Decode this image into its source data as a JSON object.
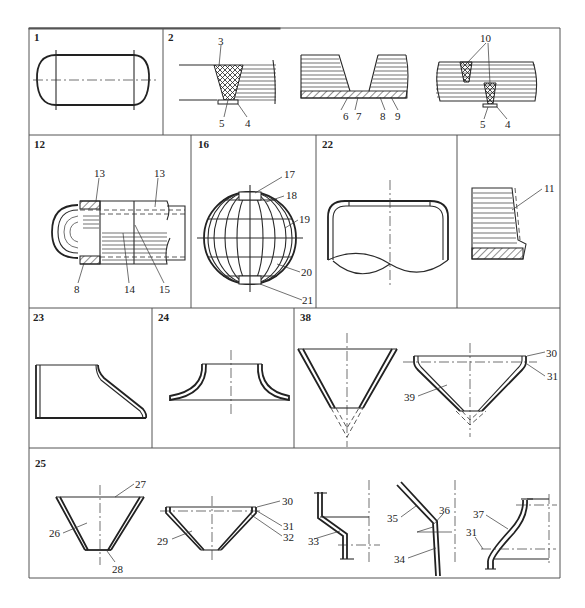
{
  "figure": {
    "panels": [
      {
        "id": "1",
        "label": "1",
        "subject": "cylindrical vessel with hemispherical heads",
        "callouts": []
      },
      {
        "id": "2",
        "label": "2",
        "subject": "weld joint cross-sections",
        "callouts": [
          "3",
          "4",
          "5",
          "6",
          "7",
          "8",
          "9",
          "10",
          "5",
          "4"
        ]
      },
      {
        "id": "12",
        "label": "12",
        "subject": "cutaway vessel with cladding",
        "callouts": [
          "13",
          "13",
          "8",
          "14",
          "15"
        ]
      },
      {
        "id": "16",
        "label": "16",
        "subject": "spherical vessel segmented construction",
        "callouts": [
          "17",
          "18",
          "19",
          "20",
          "21"
        ]
      },
      {
        "id": "22",
        "label": "22",
        "subject": "dished end",
        "callouts": []
      },
      {
        "id": "11",
        "label": "",
        "subject": "lined plate section",
        "callouts": [
          "11"
        ]
      },
      {
        "id": "23",
        "label": "23",
        "subject": "offset conical shell",
        "callouts": []
      },
      {
        "id": "24",
        "label": "24",
        "subject": "flared (toroidal) head",
        "callouts": []
      },
      {
        "id": "38",
        "label": "38",
        "subject": "conical heads",
        "callouts": [
          "30",
          "31",
          "39"
        ]
      },
      {
        "id": "25",
        "label": "25",
        "subject": "conical reducers and knuckles",
        "callouts": [
          "27",
          "26",
          "28",
          "30",
          "31",
          "32",
          "29",
          "33",
          "35",
          "36",
          "34",
          "37",
          "31"
        ]
      }
    ]
  },
  "labels": {
    "p1": "1",
    "p2": "2",
    "p12": "12",
    "p16": "16",
    "p22": "22",
    "p23": "23",
    "p24": "24",
    "p38": "38",
    "p25": "25",
    "c3": "3",
    "c4a": "4",
    "c5a": "5",
    "c6": "6",
    "c7": "7",
    "c8a": "8",
    "c9": "9",
    "c10": "10",
    "c5b": "5",
    "c4b": "4",
    "c13a": "13",
    "c13b": "13",
    "c8b": "8",
    "c14": "14",
    "c15": "15",
    "c17": "17",
    "c18": "18",
    "c19": "19",
    "c20": "20",
    "c21": "21",
    "c11": "11",
    "c30a": "30",
    "c31a": "31",
    "c39": "39",
    "c27": "27",
    "c26": "26",
    "c28": "28",
    "c30b": "30",
    "c31b": "31",
    "c32": "32",
    "c29": "29",
    "c33": "33",
    "c35": "35",
    "c36": "36",
    "c34": "34",
    "c37": "37",
    "c31c": "31"
  },
  "colors": {
    "line": "#222222",
    "frame": "#555555",
    "background": "#ffffff"
  }
}
